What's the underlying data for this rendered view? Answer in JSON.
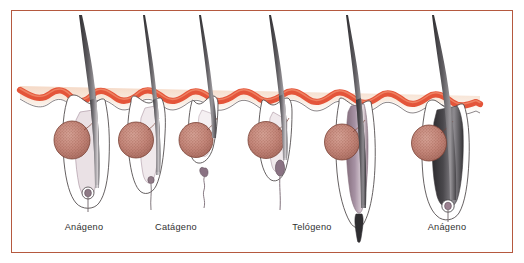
{
  "figure": {
    "border_color": "#b5593f",
    "background_color": "#ffffff"
  },
  "palette": {
    "epidermis_red": "#e4553a",
    "epidermis_highlight": "#ef7f5e",
    "dermis_cream": "#f6e3d4",
    "gland_fill": "#c98a7d",
    "gland_stipple": "#8d4a3d",
    "gland_outline": "#7a4236",
    "hair_dark": "#3b3a3c",
    "hair_mid": "#6d6b6f",
    "hair_light": "#d8d4d6",
    "sheath_mauve": "#9b8190",
    "sheath_light": "#efe7ea",
    "outline_gray": "#4a4446",
    "label_color": "#2f2f2f"
  },
  "labels": [
    {
      "name": "anagen-left",
      "text": "Anágeno",
      "x": 84,
      "y": 228
    },
    {
      "name": "catagen",
      "text": "Catágeno",
      "x": 176,
      "y": 228
    },
    {
      "name": "telogen",
      "text": "Telógeno",
      "x": 312,
      "y": 228
    },
    {
      "name": "anagen-right",
      "text": "Anágeno",
      "x": 447,
      "y": 228
    }
  ],
  "follicles": [
    {
      "name": "follicle-1-anagen-early",
      "phase": "Anágeno",
      "index": 1,
      "center_x": 88,
      "has_shaft": true,
      "has_gland": true,
      "has_papilla": true,
      "bulb_depth": 200
    },
    {
      "name": "follicle-2-catagen",
      "phase": "Catágeno",
      "index": 2,
      "center_x": 152,
      "has_shaft": true,
      "has_gland": true,
      "has_papilla": true,
      "bulb_depth": 185
    },
    {
      "name": "follicle-3-telogen-shed",
      "phase": "Telógeno",
      "index": 3,
      "center_x": 212,
      "has_shaft": true,
      "has_gland": true,
      "has_papilla": false,
      "bulb_depth": 155
    },
    {
      "name": "follicle-4-telogen",
      "phase": "Telógeno",
      "index": 4,
      "center_x": 282,
      "has_shaft": true,
      "has_gland": true,
      "has_papilla": false,
      "bulb_depth": 175
    },
    {
      "name": "follicle-5-anagen-new",
      "phase": "Anágeno",
      "index": 5,
      "center_x": 358,
      "has_shaft": true,
      "has_gland": true,
      "has_papilla": true,
      "bulb_depth": 225
    },
    {
      "name": "follicle-6-anagen-full",
      "phase": "Anágeno",
      "index": 6,
      "center_x": 445,
      "has_shaft": true,
      "has_gland": true,
      "has_papilla": true,
      "bulb_depth": 215
    }
  ],
  "structures": [
    {
      "name": "epidermis-band",
      "label": "Epidermis",
      "color": "#e4553a"
    },
    {
      "name": "dermis-layer",
      "label": "Dermis",
      "color": "#f6e3d4"
    },
    {
      "name": "sebaceous-gland",
      "label": "Glándula sebácea",
      "color": "#c98a7d"
    },
    {
      "name": "hair-shaft",
      "label": "Tallo piloso",
      "color": "#3b3a3c"
    },
    {
      "name": "dermal-papilla",
      "label": "Papila dérmica",
      "color": "#9b8190"
    },
    {
      "name": "club-hair",
      "label": "Pelo en maza",
      "color": "#8a7283"
    }
  ]
}
